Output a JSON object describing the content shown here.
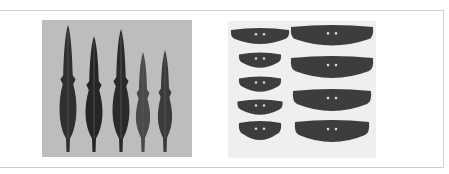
{
  "figure": {
    "left_panel": {
      "subject": "bronze spearheads",
      "count": 5,
      "background": "#bdbdbd",
      "object_color": "#2e2e2e",
      "items": [
        {
          "cx": 26,
          "tip": 5,
          "width": 19,
          "shade": "#2f2f2f"
        },
        {
          "cx": 52,
          "tip": 16,
          "width": 19,
          "shade": "#252525"
        },
        {
          "cx": 79,
          "tip": 9,
          "width": 19,
          "shade": "#2a2a2a"
        },
        {
          "cx": 101,
          "tip": 32,
          "width": 16,
          "shade": "#4a4a4a"
        },
        {
          "cx": 123,
          "tip": 30,
          "width": 16,
          "shade": "#3a3a3a"
        }
      ]
    },
    "right_panel": {
      "subject": "perforated stone knives",
      "count": 9,
      "background": "#efefef",
      "object_color": "#3d3d3d",
      "left_column": [
        {
          "cx": 32,
          "cy": 16,
          "w": 58,
          "h": 18
        },
        {
          "cx": 32,
          "cy": 40,
          "w": 42,
          "h": 17
        },
        {
          "cx": 32,
          "cy": 64,
          "w": 42,
          "h": 17
        },
        {
          "cx": 32,
          "cy": 87,
          "w": 45,
          "h": 17
        },
        {
          "cx": 32,
          "cy": 111,
          "w": 42,
          "h": 22
        }
      ],
      "right_column": [
        {
          "cx": 104,
          "cy": 16,
          "w": 82,
          "h": 24
        },
        {
          "cx": 104,
          "cy": 48,
          "w": 82,
          "h": 26
        },
        {
          "cx": 104,
          "cy": 81,
          "w": 78,
          "h": 26
        },
        {
          "cx": 104,
          "cy": 112,
          "w": 74,
          "h": 26
        }
      ]
    }
  }
}
